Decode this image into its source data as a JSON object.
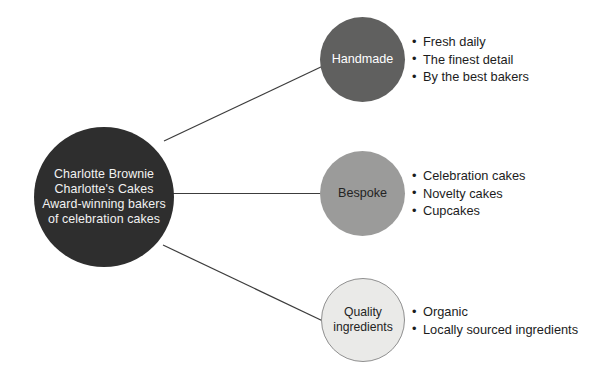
{
  "diagram": {
    "type": "hub-and-spoke",
    "hub": {
      "name": "charlotte-brownie-hub",
      "text": "Charlotte Brownie\nCharlotte's Cakes\nAward-winning bakers\nof celebration cakes",
      "fill": "#2e2e2e",
      "text_color": "#f2f2f2"
    },
    "branches": [
      {
        "id": "handmade",
        "label": "Handmade",
        "fill": "#60605f",
        "text_color": "#ffffff",
        "items": [
          "Fresh daily",
          "The finest detail",
          "By the best bakers"
        ]
      },
      {
        "id": "bespoke",
        "label": "Bespoke",
        "fill": "#9b9b9a",
        "text_color": "#242424",
        "items": [
          "Celebration cakes",
          "Novelty cakes",
          "Cupcakes"
        ]
      },
      {
        "id": "quality-ingredients",
        "label": "Quality\ningredients",
        "fill": "#eaeae8",
        "text_color": "#242424",
        "border": "#8f8f8f",
        "items": [
          "Organic",
          "Locally sourced ingredients"
        ]
      }
    ],
    "connector_color": "#3c3c3c",
    "background": "#ffffff"
  }
}
